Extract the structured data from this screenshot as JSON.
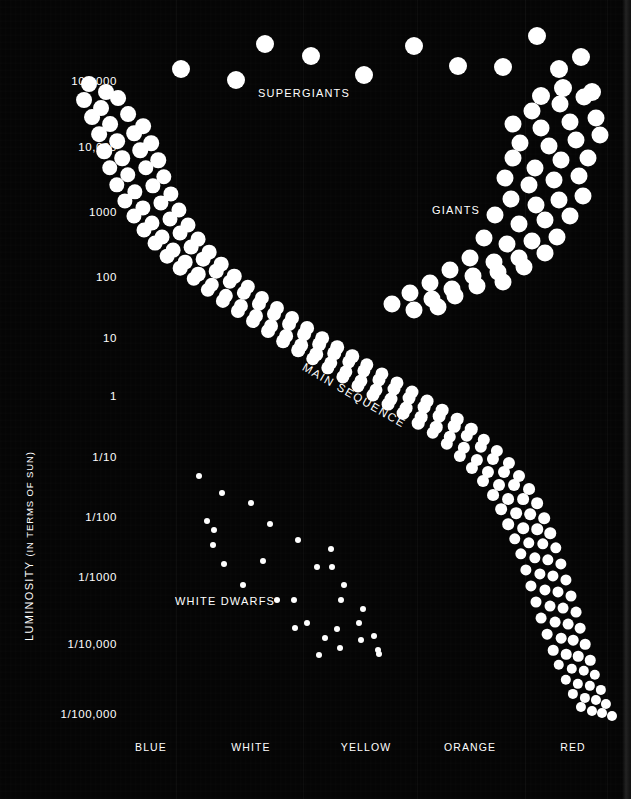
{
  "figure": {
    "background_color": "#050505",
    "dot_color": "#ffffff",
    "axis_title": "LUMINOSITY",
    "axis_title_sub": "(IN TERMS OF SUN)"
  },
  "y_axis": {
    "label": "LUMINOSITY  (IN TERMS OF SUN)",
    "ticks": [
      {
        "text": "100,000",
        "y": 82
      },
      {
        "text": "10,000",
        "y": 148
      },
      {
        "text": "1000",
        "y": 213
      },
      {
        "text": "100",
        "y": 278
      },
      {
        "text": "10",
        "y": 339
      },
      {
        "text": "1",
        "y": 397
      },
      {
        "text": "1/10",
        "y": 458
      },
      {
        "text": "1/100",
        "y": 518
      },
      {
        "text": "1/1000",
        "y": 578
      },
      {
        "text": "1/10,000",
        "y": 645
      },
      {
        "text": "1/100,000",
        "y": 715
      }
    ]
  },
  "x_axis": {
    "ticks": [
      {
        "text": "BLUE",
        "x": 151
      },
      {
        "text": "WHITE",
        "x": 251
      },
      {
        "text": "YELLOW",
        "x": 366
      },
      {
        "text": "ORANGE",
        "x": 470
      },
      {
        "text": "RED",
        "x": 573
      }
    ]
  },
  "annotations": [
    {
      "name": "supergiants",
      "text": "SUPERGIANTS",
      "x": 258,
      "y": 88
    },
    {
      "name": "giants",
      "text": "GIANTS",
      "x": 432,
      "y": 205
    },
    {
      "name": "white-dwarfs",
      "text": "WHITE DWARFS",
      "x": 175,
      "y": 596
    },
    {
      "name": "main-sequence",
      "text": "MAIN SEQUENCE",
      "x": 303,
      "y": 361,
      "rotation": 30
    }
  ],
  "gridlines": [
    176,
    303,
    417,
    525,
    607
  ],
  "chart_data": {
    "type": "scatter",
    "xlabel": "",
    "ylabel": "LUMINOSITY (IN TERMS OF SUN)",
    "x_categories": [
      "BLUE",
      "WHITE",
      "YELLOW",
      "ORANGE",
      "RED"
    ],
    "y_tick_labels": [
      "100,000",
      "10,000",
      "1000",
      "100",
      "10",
      "1",
      "1/10",
      "1/100",
      "1/1000",
      "1/10,000",
      "1/100,000"
    ],
    "y_scale": "log",
    "ylim": [
      1e-05,
      100000
    ],
    "grid": false,
    "legend": "none",
    "series": [
      {
        "name": "SUPERGIANTS",
        "dot_radius": 9,
        "points": [
          [
            181,
            69
          ],
          [
            236,
            80
          ],
          [
            265,
            44
          ],
          [
            311,
            56
          ],
          [
            364,
            75
          ],
          [
            414,
            46
          ],
          [
            458,
            66
          ],
          [
            503,
            67
          ],
          [
            537,
            36
          ],
          [
            559,
            69
          ],
          [
            581,
            57
          ],
          [
            563,
            88
          ],
          [
            592,
            92
          ],
          [
            541,
            96
          ]
        ]
      },
      {
        "name": "GIANTS",
        "dot_radius": 8.5,
        "points": [
          [
            532,
            111
          ],
          [
            560,
            104
          ],
          [
            584,
            97
          ],
          [
            513,
            124
          ],
          [
            541,
            128
          ],
          [
            570,
            122
          ],
          [
            596,
            118
          ],
          [
            520,
            143
          ],
          [
            549,
            146
          ],
          [
            576,
            140
          ],
          [
            600,
            135
          ],
          [
            513,
            158
          ],
          [
            535,
            168
          ],
          [
            561,
            160
          ],
          [
            588,
            158
          ],
          [
            505,
            178
          ],
          [
            529,
            185
          ],
          [
            554,
            180
          ],
          [
            579,
            176
          ],
          [
            511,
            199
          ],
          [
            536,
            205
          ],
          [
            559,
            200
          ],
          [
            583,
            196
          ],
          [
            495,
            215
          ],
          [
            519,
            224
          ],
          [
            545,
            220
          ],
          [
            570,
            216
          ],
          [
            484,
            238
          ],
          [
            507,
            244
          ],
          [
            532,
            241
          ],
          [
            557,
            237
          ],
          [
            470,
            258
          ],
          [
            494,
            262
          ],
          [
            519,
            258
          ],
          [
            545,
            253
          ],
          [
            450,
            270
          ],
          [
            473,
            276
          ],
          [
            498,
            272
          ],
          [
            524,
            267
          ],
          [
            430,
            283
          ],
          [
            452,
            289
          ],
          [
            477,
            286
          ],
          [
            503,
            282
          ],
          [
            410,
            293
          ],
          [
            432,
            299
          ],
          [
            455,
            296
          ],
          [
            392,
            304
          ],
          [
            414,
            310
          ],
          [
            438,
            307
          ]
        ]
      },
      {
        "name": "MAIN SEQUENCE",
        "dot_radius_start": 8.0,
        "dot_radius_end": 5.0,
        "points": [
          [
            89,
            84
          ],
          [
            106,
            92
          ],
          [
            84,
            100
          ],
          [
            101,
            108
          ],
          [
            118,
            98
          ],
          [
            92,
            117
          ],
          [
            110,
            124
          ],
          [
            128,
            114
          ],
          [
            143,
            126
          ],
          [
            99,
            134
          ],
          [
            117,
            141
          ],
          [
            134,
            133
          ],
          [
            151,
            143
          ],
          [
            104,
            151
          ],
          [
            122,
            158
          ],
          [
            140,
            150
          ],
          [
            158,
            160
          ],
          [
            110,
            168
          ],
          [
            128,
            175
          ],
          [
            146,
            168
          ],
          [
            164,
            177
          ],
          [
            117,
            185
          ],
          [
            135,
            192
          ],
          [
            153,
            186
          ],
          [
            171,
            194
          ],
          [
            125,
            201
          ],
          [
            143,
            208
          ],
          [
            161,
            203
          ],
          [
            179,
            210
          ],
          [
            134,
            216
          ],
          [
            152,
            223
          ],
          [
            170,
            219
          ],
          [
            188,
            225
          ],
          [
            144,
            230
          ],
          [
            162,
            237
          ],
          [
            180,
            233
          ],
          [
            198,
            239
          ],
          [
            155,
            243
          ],
          [
            173,
            250
          ],
          [
            191,
            247
          ],
          [
            209,
            252
          ],
          [
            167,
            256
          ],
          [
            185,
            262
          ],
          [
            203,
            259
          ],
          [
            221,
            264
          ],
          [
            180,
            268
          ],
          [
            198,
            274
          ],
          [
            216,
            271
          ],
          [
            234,
            276
          ],
          [
            194,
            279
          ],
          [
            212,
            285
          ],
          [
            230,
            282
          ],
          [
            248,
            287
          ],
          [
            208,
            290
          ],
          [
            226,
            296
          ],
          [
            244,
            293
          ],
          [
            262,
            298
          ],
          [
            223,
            301
          ],
          [
            241,
            306
          ],
          [
            259,
            304
          ],
          [
            277,
            308
          ],
          [
            238,
            311
          ],
          [
            256,
            316
          ],
          [
            274,
            314
          ],
          [
            292,
            318
          ],
          [
            253,
            321
          ],
          [
            271,
            326
          ],
          [
            289,
            324
          ],
          [
            307,
            328
          ],
          [
            268,
            331
          ],
          [
            286,
            336
          ],
          [
            304,
            334
          ],
          [
            322,
            338
          ],
          [
            283,
            341
          ],
          [
            301,
            345
          ],
          [
            319,
            344
          ],
          [
            337,
            347
          ],
          [
            298,
            350
          ],
          [
            316,
            354
          ],
          [
            334,
            353
          ],
          [
            352,
            356
          ],
          [
            313,
            359
          ],
          [
            331,
            363
          ],
          [
            349,
            362
          ],
          [
            367,
            365
          ],
          [
            328,
            368
          ],
          [
            346,
            372
          ],
          [
            364,
            371
          ],
          [
            382,
            374
          ],
          [
            343,
            377
          ],
          [
            361,
            381
          ],
          [
            379,
            380
          ],
          [
            397,
            383
          ],
          [
            358,
            386
          ],
          [
            376,
            390
          ],
          [
            394,
            389
          ],
          [
            412,
            392
          ],
          [
            373,
            395
          ],
          [
            391,
            399
          ],
          [
            409,
            398
          ],
          [
            427,
            401
          ],
          [
            388,
            404
          ],
          [
            406,
            408
          ],
          [
            424,
            407
          ],
          [
            442,
            410
          ],
          [
            403,
            413
          ],
          [
            421,
            417
          ],
          [
            439,
            416
          ],
          [
            457,
            419
          ],
          [
            418,
            423
          ],
          [
            436,
            427
          ],
          [
            454,
            426
          ],
          [
            471,
            429
          ],
          [
            433,
            433
          ],
          [
            450,
            437
          ],
          [
            467,
            436
          ],
          [
            484,
            440
          ],
          [
            447,
            444
          ],
          [
            464,
            448
          ],
          [
            481,
            447
          ],
          [
            497,
            451
          ],
          [
            460,
            456
          ],
          [
            477,
            460
          ],
          [
            493,
            459
          ],
          [
            509,
            463
          ],
          [
            472,
            468
          ],
          [
            488,
            472
          ],
          [
            504,
            472
          ],
          [
            519,
            476
          ],
          [
            483,
            481
          ],
          [
            499,
            485
          ],
          [
            514,
            485
          ],
          [
            529,
            489
          ],
          [
            493,
            495
          ],
          [
            508,
            499
          ],
          [
            523,
            499
          ],
          [
            537,
            503
          ],
          [
            501,
            509
          ],
          [
            516,
            513
          ],
          [
            530,
            514
          ],
          [
            544,
            518
          ],
          [
            508,
            524
          ],
          [
            523,
            528
          ],
          [
            537,
            529
          ],
          [
            550,
            533
          ],
          [
            515,
            539
          ],
          [
            529,
            543
          ],
          [
            543,
            544
          ],
          [
            556,
            548
          ],
          [
            521,
            554
          ],
          [
            535,
            558
          ],
          [
            548,
            560
          ],
          [
            561,
            564
          ],
          [
            526,
            570
          ],
          [
            540,
            574
          ],
          [
            553,
            576
          ],
          [
            566,
            580
          ],
          [
            531,
            586
          ],
          [
            545,
            590
          ],
          [
            558,
            592
          ],
          [
            571,
            596
          ],
          [
            536,
            602
          ],
          [
            550,
            606
          ],
          [
            563,
            608
          ],
          [
            576,
            612
          ],
          [
            541,
            618
          ],
          [
            555,
            622
          ],
          [
            568,
            624
          ],
          [
            580,
            628
          ],
          [
            547,
            634
          ],
          [
            561,
            638
          ],
          [
            573,
            640
          ],
          [
            585,
            644
          ],
          [
            553,
            650
          ],
          [
            566,
            654
          ],
          [
            578,
            656
          ],
          [
            590,
            660
          ],
          [
            559,
            665
          ],
          [
            572,
            669
          ],
          [
            584,
            671
          ],
          [
            595,
            675
          ],
          [
            566,
            680
          ],
          [
            578,
            684
          ],
          [
            590,
            686
          ],
          [
            601,
            690
          ],
          [
            573,
            694
          ],
          [
            585,
            698
          ],
          [
            596,
            700
          ],
          [
            606,
            704
          ],
          [
            581,
            707
          ],
          [
            592,
            711
          ],
          [
            602,
            713
          ],
          [
            612,
            716
          ]
        ]
      },
      {
        "name": "WHITE DWARFS",
        "dot_radius": 3.0,
        "points": [
          [
            199,
            476
          ],
          [
            222,
            493
          ],
          [
            251,
            503
          ],
          [
            207,
            521
          ],
          [
            270,
            524
          ],
          [
            214,
            530
          ],
          [
            298,
            540
          ],
          [
            213,
            545
          ],
          [
            331,
            549
          ],
          [
            263,
            561
          ],
          [
            224,
            564
          ],
          [
            332,
            567
          ],
          [
            317,
            567
          ],
          [
            243,
            585
          ],
          [
            277,
            600
          ],
          [
            294,
            600
          ],
          [
            344,
            585
          ],
          [
            341,
            600
          ],
          [
            363,
            609
          ],
          [
            295,
            628
          ],
          [
            337,
            629
          ],
          [
            359,
            623
          ],
          [
            325,
            638
          ],
          [
            361,
            640
          ],
          [
            374,
            636
          ],
          [
            340,
            648
          ],
          [
            378,
            650
          ],
          [
            379,
            654
          ],
          [
            319,
            655
          ],
          [
            307,
            623
          ]
        ]
      }
    ]
  }
}
